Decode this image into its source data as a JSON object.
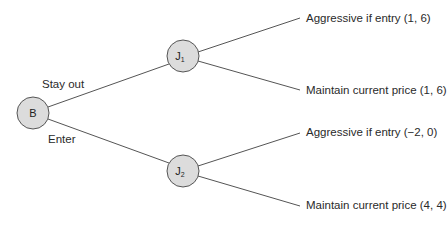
{
  "diagram": {
    "type": "game-tree",
    "nodes": {
      "root": {
        "label": "B"
      },
      "j1": {
        "label": "J",
        "subscript": "1"
      },
      "j2": {
        "label": "J",
        "subscript": "2"
      }
    },
    "branches": {
      "stay_out": "Stay out",
      "enter": "Enter"
    },
    "outcomes": [
      {
        "text": "Aggressive if entry  (1, 6)"
      },
      {
        "text": "Maintain current price  (1, 6)"
      },
      {
        "text": "Aggressive if entry  (−2, 0)"
      },
      {
        "text": "Maintain current price  (4, 4)"
      }
    ],
    "colors": {
      "node_fill": "#dcdcdc",
      "node_stroke": "#555555",
      "line": "#555555"
    }
  }
}
